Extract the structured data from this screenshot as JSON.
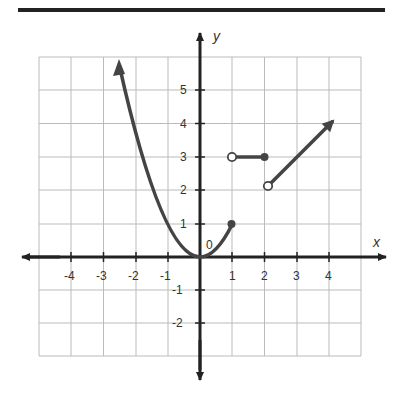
{
  "diagram": {
    "type": "piecewise-function-graph",
    "axes": {
      "x_label": "x",
      "y_label": "y",
      "origin_label": "0",
      "x_tick_labels": [
        "-4",
        "-3",
        "-2",
        "-1",
        "1",
        "2",
        "3",
        "4"
      ],
      "y_tick_labels": [
        "5",
        "4",
        "3",
        "2",
        "1",
        "-1",
        "-2"
      ],
      "x_range": [
        -5,
        5
      ],
      "y_range": [
        -3,
        6
      ],
      "grid": true
    },
    "pieces": [
      {
        "name": "parabola",
        "equation": "y = x^2",
        "domain": "x <= 1",
        "left_end": "arrow",
        "right_end": {
          "point": [
            1,
            1
          ],
          "style": "closed"
        }
      },
      {
        "name": "constant",
        "equation": "y = 3",
        "domain": "1 < x <= 2",
        "left_end": {
          "point": [
            1,
            3
          ],
          "style": "open"
        },
        "right_end": {
          "point": [
            2,
            3
          ],
          "style": "closed"
        }
      },
      {
        "name": "line",
        "equation": "y = x",
        "domain": "x > 2",
        "left_end": {
          "point": [
            2,
            2
          ],
          "style": "open"
        },
        "right_end": "arrow"
      }
    ],
    "colors": {
      "curve": "#444444",
      "axis": "#222222",
      "grid": "#bbbbbb",
      "rule": "#222222"
    }
  }
}
